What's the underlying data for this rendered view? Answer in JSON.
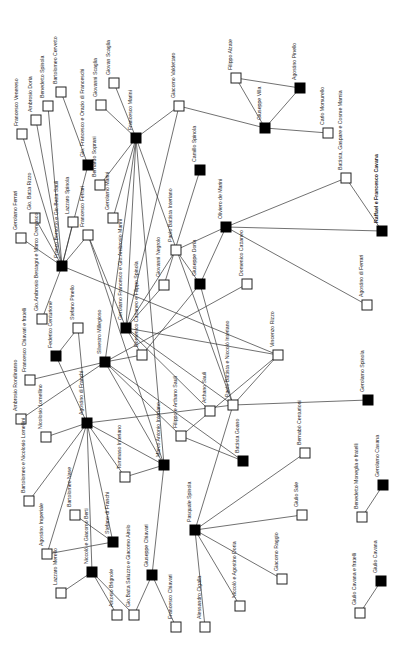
{
  "diagram": {
    "title": "",
    "orientation": "rotated-90",
    "node_size": 10,
    "colors": {
      "edge": "#333333",
      "filled": "#000000",
      "open_fill": "#ffffff",
      "text": "#222222"
    },
    "nodes": [
      {
        "id": "francesco_venereso",
        "label": "Francesco Venereso",
        "x": 22,
        "y": 134,
        "filled": false
      },
      {
        "id": "ambrosio_doria",
        "label": "Ambrosio Doria",
        "x": 36,
        "y": 120,
        "filled": false
      },
      {
        "id": "benedetto_spinola",
        "label": "Benedetto Spinola",
        "x": 48,
        "y": 106,
        "filled": false
      },
      {
        "id": "bartolomeo_cervetto",
        "label": "Bartolomeo Cervetto",
        "x": 61,
        "y": 92,
        "filled": false
      },
      {
        "id": "gio_francesco_orazio",
        "label": "Gio. Francesco e Orazio di Franceschi",
        "x": 88,
        "y": 165,
        "filled": true
      },
      {
        "id": "giovanni_scaglia",
        "label": "Giovanni Scaglia",
        "x": 101,
        "y": 105,
        "filled": false
      },
      {
        "id": "giovan_scaglia",
        "label": "Giovan Scaglia",
        "x": 114,
        "y": 83,
        "filled": false
      },
      {
        "id": "bernardo_sopranii",
        "label": "Bernardo Soprani",
        "x": 100,
        "y": 185,
        "filled": false
      },
      {
        "id": "francesco_marini",
        "label": "Francesco Marini",
        "x": 136,
        "y": 138,
        "filled": true
      },
      {
        "id": "giacomo_valdettaro",
        "label": "Giacomo Valdettaro",
        "x": 179,
        "y": 106,
        "filled": false
      },
      {
        "id": "camillo_spinola",
        "label": "Camillo Spinola",
        "x": 200,
        "y": 170,
        "filled": true
      },
      {
        "id": "filippo_alzate",
        "label": "Filippo Alzate",
        "x": 236,
        "y": 78,
        "filled": false
      },
      {
        "id": "agostino_pinello",
        "label": "Agostino Pinello",
        "x": 300,
        "y": 88,
        "filled": true
      },
      {
        "id": "giuseppe_villa",
        "label": "Giuseppe Villa",
        "x": 265,
        "y": 128,
        "filled": true
      },
      {
        "id": "carlo_morsurello",
        "label": "Carlo Morsurello",
        "x": 328,
        "y": 133,
        "filled": false
      },
      {
        "id": "battista_gaspare_cosme",
        "label": "Battista, Gaspare e Cosme Marnia",
        "x": 346,
        "y": 178,
        "filled": false
      },
      {
        "id": "raffael_francesco_cavana",
        "label": "Raffael e Francesco Cavana",
        "x": 382,
        "y": 231,
        "filled": true
      },
      {
        "id": "gerolamo_ferrari",
        "label": "Gerolamo Ferrari",
        "x": 21,
        "y": 238,
        "filled": false
      },
      {
        "id": "gio_batta_rizzo",
        "label": "Gio. Batta Rizzo",
        "x": 35,
        "y": 218,
        "filled": false
      },
      {
        "id": "lazzaro_spinola",
        "label": "Lazzaro Spinola",
        "x": 73,
        "y": 222,
        "filled": false
      },
      {
        "id": "francesco_ferrari",
        "label": "Francesco Ferrari",
        "x": 88,
        "y": 235,
        "filled": false
      },
      {
        "id": "gerolamo_marini",
        "label": "Gerolamo Marini",
        "x": 113,
        "y": 218,
        "filled": false
      },
      {
        "id": "franco_borsotto",
        "label": "Franco Borsotto e Gio.Batta Sauli",
        "x": 62,
        "y": 266,
        "filled": true
      },
      {
        "id": "paolo_battista_interiano",
        "label": "Paolo Battista Interiano",
        "x": 176,
        "y": 250,
        "filled": false
      },
      {
        "id": "giuseppe_doria",
        "label": "Giuseppe Doria",
        "x": 200,
        "y": 284,
        "filled": true
      },
      {
        "id": "oliviero_de_marini",
        "label": "Oliviero de Marini",
        "x": 226,
        "y": 227,
        "filled": true
      },
      {
        "id": "giovanni_negrolo",
        "label": "Giovanni Negrolo",
        "x": 164,
        "y": 285,
        "filled": false
      },
      {
        "id": "domenico_cattaneo",
        "label": "Domenico Cattaneo",
        "x": 247,
        "y": 284,
        "filled": false
      },
      {
        "id": "agostino_di_ferrari",
        "label": "Agostino di Ferrari",
        "x": 367,
        "y": 305,
        "filled": false
      },
      {
        "id": "gio_ambrosio_bestagni",
        "label": "Gio.Ambrosio Bestagni e Marco Cremasco",
        "x": 42,
        "y": 319,
        "filled": false
      },
      {
        "id": "stefano_pinello",
        "label": "Stefano Pinello",
        "x": 78,
        "y": 328,
        "filled": false
      },
      {
        "id": "gerolamo_francesco_filippo",
        "label": "Gerolamo Francesco e Gio.Ambrosio Marini",
        "x": 126,
        "y": 328,
        "filled": true
      },
      {
        "id": "federico_centurione",
        "label": "Federico Centurione",
        "x": 56,
        "y": 356,
        "filled": true
      },
      {
        "id": "silvestro_millegioso",
        "label": "Silvestro Millegioso",
        "x": 105,
        "y": 362,
        "filled": true
      },
      {
        "id": "domenico_cattaneo_filippo",
        "label": "Domenico Cattaneo e Filippo Spinola",
        "x": 142,
        "y": 355,
        "filled": false
      },
      {
        "id": "francesco_chiavari_fratelli",
        "label": "Francesco Chiavari e fratelli",
        "x": 30,
        "y": 380,
        "filled": false
      },
      {
        "id": "ambrosio_rondinanno",
        "label": "Ambrosio Rondinanno",
        "x": 21,
        "y": 419,
        "filled": false
      },
      {
        "id": "vincenzo_rizzo",
        "label": "Vincenzo Rizzo",
        "x": 278,
        "y": 355,
        "filled": false
      },
      {
        "id": "paolo_battista_niccolo",
        "label": "Paolo Battista e Niccolò Interiano",
        "x": 233,
        "y": 405,
        "filled": false
      },
      {
        "id": "arthano_sauli",
        "label": "Arthano Sauli",
        "x": 210,
        "y": 411,
        "filled": false
      },
      {
        "id": "filippo_arthano_sauli",
        "label": "Filippo e Arthano Sauli",
        "x": 181,
        "y": 436,
        "filled": false
      },
      {
        "id": "agostino_di_franchi",
        "label": "Agostino di Franchi",
        "x": 87,
        "y": 423,
        "filled": true
      },
      {
        "id": "nicolosio_lomellino",
        "label": "Nicolosio Lomellino",
        "x": 46,
        "y": 437,
        "filled": false
      },
      {
        "id": "gerolamo_spinola",
        "label": "Gerolamo Spinola",
        "x": 368,
        "y": 400,
        "filled": true
      },
      {
        "id": "battista_goano",
        "label": "Battista Goano",
        "x": 243,
        "y": 461,
        "filled": true
      },
      {
        "id": "bernabo_centurioni",
        "label": "Bernabò Centurioni",
        "x": 305,
        "y": 453,
        "filled": false
      },
      {
        "id": "tommaso_interiano",
        "label": "Tommaso Interiano",
        "x": 125,
        "y": 477,
        "filled": false
      },
      {
        "id": "marco_antonio_interiano",
        "label": "Marco Antonio Interiano",
        "x": 164,
        "y": 465,
        "filled": true
      },
      {
        "id": "bartolomeo_nicolosio",
        "label": "Bartolomeo e Nicolosio Lomellini",
        "x": 29,
        "y": 501,
        "filled": false
      },
      {
        "id": "agostino_imperiale",
        "label": "Agostino Imperiale",
        "x": 47,
        "y": 554,
        "filled": false
      },
      {
        "id": "bartolomeo_nase",
        "label": "Bartolomeo Nase",
        "x": 75,
        "y": 515,
        "filled": false
      },
      {
        "id": "stefano_di_franchi",
        "label": "Stefano di Franchi",
        "x": 113,
        "y": 542,
        "filled": true
      },
      {
        "id": "niccolo_giacomo_berti",
        "label": "Niccolò e Giacomo Berti",
        "x": 92,
        "y": 572,
        "filled": true
      },
      {
        "id": "lazzaro_merello",
        "label": "Lazzaro Merello",
        "x": 61,
        "y": 593,
        "filled": false
      },
      {
        "id": "antonio_brignole",
        "label": "Antonio Brignole",
        "x": 117,
        "y": 615,
        "filled": false
      },
      {
        "id": "giobatta_saluzzo",
        "label": "Gio.Batta Saluzzo e Giacomo Airolo",
        "x": 134,
        "y": 615,
        "filled": false
      },
      {
        "id": "giuseppe_chiavari",
        "label": "Giuseppe Chiavari",
        "x": 152,
        "y": 575,
        "filled": true
      },
      {
        "id": "francesco_chiavari",
        "label": "Francesco Chiavari",
        "x": 176,
        "y": 627,
        "filled": false
      },
      {
        "id": "pasquale_spinola",
        "label": "Pasquale Spinola",
        "x": 195,
        "y": 530,
        "filled": true
      },
      {
        "id": "giulio_sale",
        "label": "Giulio Sale",
        "x": 302,
        "y": 515,
        "filled": false
      },
      {
        "id": "giacomo_raggio",
        "label": "Giacomo Raggio",
        "x": 282,
        "y": 579,
        "filled": false
      },
      {
        "id": "niccolo_agostino_doria",
        "label": "Niccolò e Agostino Doria",
        "x": 240,
        "y": 606,
        "filled": false
      },
      {
        "id": "alessandro_cigalla",
        "label": "Alessandro Cigalla",
        "x": 205,
        "y": 627,
        "filled": false
      },
      {
        "id": "benedetto_moneglia",
        "label": "Benedetto Moneglia e fratelli",
        "x": 362,
        "y": 517,
        "filled": false
      },
      {
        "id": "gerolamo_cavana",
        "label": "Gerolamo Cavana",
        "x": 383,
        "y": 485,
        "filled": true
      },
      {
        "id": "giulio_cavana_fratelli",
        "label": "Giulio Cavana e fratelli",
        "x": 360,
        "y": 613,
        "filled": false
      },
      {
        "id": "giulio_cavana",
        "label": "Giulio Cavana",
        "x": 381,
        "y": 581,
        "filled": true
      }
    ],
    "edges": [
      [
        "francesco_venereso",
        "franco_borsotto"
      ],
      [
        "ambrosio_doria",
        "franco_borsotto"
      ],
      [
        "benedetto_spinola",
        "franco_borsotto"
      ],
      [
        "bartolomeo_cervetto",
        "gio_francesco_orazio"
      ],
      [
        "giovanni_scaglia",
        "francesco_marini"
      ],
      [
        "giovan_scaglia",
        "francesco_marini"
      ],
      [
        "bernardo_sopranii",
        "francesco_marini"
      ],
      [
        "gerolamo_marini",
        "francesco_marini"
      ],
      [
        "francesco_marini",
        "giacomo_valdettaro"
      ],
      [
        "francesco_marini",
        "gerolamo_francesco_filippo"
      ],
      [
        "francesco_marini",
        "silvestro_millegioso"
      ],
      [
        "francesco_marini",
        "paolo_battista_niccolo"
      ],
      [
        "francesco_marini",
        "marco_antonio_interiano"
      ],
      [
        "giacomo_valdettaro",
        "giuseppe_villa"
      ],
      [
        "giacomo_valdettaro",
        "gerolamo_francesco_filippo"
      ],
      [
        "camillo_spinola",
        "giovanni_negrolo"
      ],
      [
        "filippo_alzate",
        "giuseppe_villa"
      ],
      [
        "filippo_alzate",
        "agostino_pinello"
      ],
      [
        "agostino_pinello",
        "giuseppe_villa"
      ],
      [
        "giuseppe_villa",
        "carlo_morsurello"
      ],
      [
        "battista_gaspare_cosme",
        "raffael_francesco_cavana"
      ],
      [
        "battista_gaspare_cosme",
        "oliviero_de_marini"
      ],
      [
        "oliviero_de_marini",
        "raffael_francesco_cavana"
      ],
      [
        "oliviero_de_marini",
        "agostino_di_ferrari"
      ],
      [
        "oliviero_de_marini",
        "paolo_battista_interiano"
      ],
      [
        "oliviero_de_marini",
        "giuseppe_doria"
      ],
      [
        "paolo_battista_interiano",
        "giuseppe_doria"
      ],
      [
        "paolo_battista_interiano",
        "gerolamo_francesco_filippo"
      ],
      [
        "giuseppe_doria",
        "paolo_battista_niccolo"
      ],
      [
        "giuseppe_doria",
        "domenico_cattaneo_filippo"
      ],
      [
        "domenico_cattaneo",
        "silvestro_millegioso"
      ],
      [
        "giovanni_negrolo",
        "gerolamo_francesco_filippo"
      ],
      [
        "gerolamo_ferrari",
        "franco_borsotto"
      ],
      [
        "gio_batta_rizzo",
        "franco_borsotto"
      ],
      [
        "lazzaro_spinola",
        "franco_borsotto"
      ],
      [
        "francesco_ferrari",
        "franco_borsotto"
      ],
      [
        "francesco_ferrari",
        "gerolamo_francesco_filippo"
      ],
      [
        "francesco_ferrari",
        "marco_antonio_interiano"
      ],
      [
        "franco_borsotto",
        "vincenzo_rizzo"
      ],
      [
        "franco_borsotto",
        "gio_ambrosio_bestagni"
      ],
      [
        "gio_francesco_orazio",
        "franco_borsotto"
      ],
      [
        "gerolamo_francesco_filippo",
        "vincenzo_rizzo"
      ],
      [
        "gerolamo_francesco_filippo",
        "domenico_cattaneo_filippo"
      ],
      [
        "gerolamo_francesco_filippo",
        "arthano_sauli"
      ],
      [
        "gerolamo_francesco_filippo",
        "paolo_battista_niccolo"
      ],
      [
        "stefano_pinello",
        "federico_centurione"
      ],
      [
        "stefano_pinello",
        "agostino_di_franchi"
      ],
      [
        "federico_centurione",
        "agostino_di_franchi"
      ],
      [
        "silvestro_millegioso",
        "domenico_cattaneo_filippo"
      ],
      [
        "silvestro_millegioso",
        "francesco_chiavari_fratelli"
      ],
      [
        "silvestro_millegioso",
        "ambrosio_rondinanno"
      ],
      [
        "silvestro_millegioso",
        "filippo_arthano_sauli"
      ],
      [
        "silvestro_millegioso",
        "marco_antonio_interiano"
      ],
      [
        "silvestro_millegioso",
        "battista_goano"
      ],
      [
        "vincenzo_rizzo",
        "paolo_battista_niccolo"
      ],
      [
        "vincenzo_rizzo",
        "filippo_arthano_sauli"
      ],
      [
        "paolo_battista_niccolo",
        "gerolamo_spinola"
      ],
      [
        "paolo_battista_niccolo",
        "pasquale_spinola"
      ],
      [
        "filippo_arthano_sauli",
        "battista_goano"
      ],
      [
        "agostino_di_franchi",
        "nicolosio_lomellino"
      ],
      [
        "agostino_di_franchi",
        "marco_antonio_interiano"
      ],
      [
        "agostino_di_franchi",
        "paolo_battista_niccolo"
      ],
      [
        "agostino_di_franchi",
        "tommaso_interiano"
      ],
      [
        "agostino_di_franchi",
        "bartolomeo_nicolosio"
      ],
      [
        "agostino_di_franchi",
        "agostino_imperiale"
      ],
      [
        "agostino_di_franchi",
        "stefano_di_franchi"
      ],
      [
        "agostino_di_franchi",
        "niccolo_giacomo_berti"
      ],
      [
        "tommaso_interiano",
        "marco_antonio_interiano"
      ],
      [
        "marco_antonio_interiano",
        "giuseppe_chiavari"
      ],
      [
        "bartolomeo_nase",
        "stefano_di_franchi"
      ],
      [
        "agostino_imperiale",
        "stefano_di_franchi"
      ],
      [
        "niccolo_giacomo_berti",
        "lazzaro_merello"
      ],
      [
        "niccolo_giacomo_berti",
        "antonio_brignole"
      ],
      [
        "niccolo_giacomo_berti",
        "giobatta_saluzzo"
      ],
      [
        "giuseppe_chiavari",
        "giobatta_saluzzo"
      ],
      [
        "giuseppe_chiavari",
        "francesco_chiavari"
      ],
      [
        "pasquale_spinola",
        "bernabo_centurioni"
      ],
      [
        "pasquale_spinola",
        "giulio_sale"
      ],
      [
        "pasquale_spinola",
        "giacomo_raggio"
      ],
      [
        "pasquale_spinola",
        "niccolo_agostino_doria"
      ],
      [
        "pasquale_spinola",
        "alessandro_cigalla"
      ],
      [
        "gerolamo_cavana",
        "benedetto_moneglia"
      ],
      [
        "giulio_cavana",
        "giulio_cavana_fratelli"
      ]
    ]
  }
}
